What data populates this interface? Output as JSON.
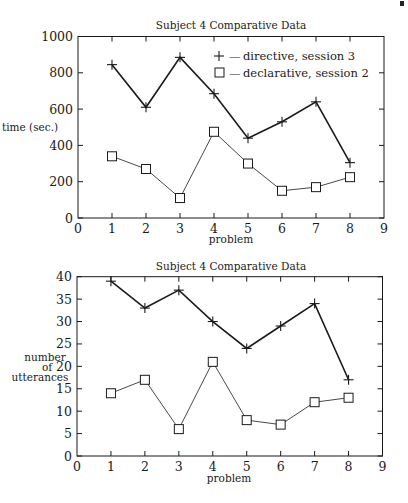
{
  "chart_data": [
    {
      "type": "line",
      "title": "Subject 4 Comparative Data",
      "xlabel": "problem",
      "ylabel": "time (sec.)",
      "xlim": [
        0,
        9
      ],
      "ylim": [
        0,
        1000
      ],
      "xticks": [
        0,
        1,
        2,
        3,
        4,
        5,
        6,
        7,
        8,
        9
      ],
      "yticks": [
        0,
        200,
        400,
        600,
        800,
        1000
      ],
      "grid": false,
      "legend_position": "upper right (inside)",
      "x": [
        1,
        2,
        3,
        4,
        5,
        6,
        7,
        8
      ],
      "series": [
        {
          "name": "directive, session 3",
          "marker": "+",
          "legend_text": "+ — directive, session 3",
          "values": [
            845,
            610,
            885,
            685,
            440,
            530,
            640,
            305
          ]
        },
        {
          "name": "declarative, session 2",
          "marker": "square",
          "legend_text": "□ — declarative, session 2",
          "values": [
            340,
            270,
            110,
            475,
            300,
            150,
            170,
            225
          ]
        }
      ]
    },
    {
      "type": "line",
      "title": "Subject 4 Comparative Data",
      "xlabel": "problem",
      "ylabel": "number of utterances",
      "ylabel_lines": [
        "number",
        "of",
        "utterances"
      ],
      "xlim": [
        0,
        9
      ],
      "ylim": [
        0,
        40
      ],
      "xticks": [
        0,
        1,
        2,
        3,
        4,
        5,
        6,
        7,
        8,
        9
      ],
      "yticks": [
        0,
        5,
        10,
        15,
        20,
        25,
        30,
        35,
        40
      ],
      "grid": false,
      "legend_position": "none",
      "x": [
        1,
        2,
        3,
        4,
        5,
        6,
        7,
        8
      ],
      "series": [
        {
          "name": "directive, session 3",
          "marker": "+",
          "values": [
            39,
            33,
            37,
            30,
            24,
            29,
            34,
            17
          ]
        },
        {
          "name": "declarative, session 2",
          "marker": "square",
          "values": [
            14,
            17,
            6,
            21,
            8,
            7,
            12,
            13
          ]
        }
      ]
    }
  ],
  "charts": {
    "top": {
      "title": "Subject 4 Comparative Data",
      "ylabel": "time (sec.)",
      "xlabel": "problem",
      "legend": {
        "directive": "directive, session 3",
        "declarative": "declarative, session 2",
        "dash": "—"
      }
    },
    "bottom": {
      "title": "Subject 4 Comparative Data",
      "ylabel_line1": "number",
      "ylabel_line2": "of",
      "ylabel_line3": "utterances",
      "xlabel": "problem"
    }
  },
  "colors": {
    "line_directive": "#1a1a1a",
    "line_declarative": "#333333",
    "axis": "#1a1a1a"
  }
}
